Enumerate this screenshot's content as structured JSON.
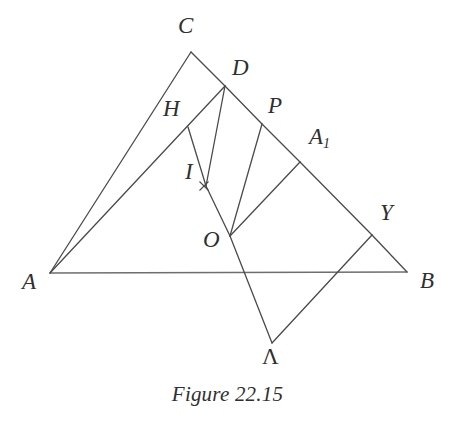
{
  "figure": {
    "caption": "Figure 22.15",
    "stroke_color": "#4a4a4a",
    "baseline_color": "#6e6e6e",
    "background_color": "#ffffff",
    "stroke_width": 1.3
  },
  "points": {
    "A": {
      "label": "A",
      "x": 50,
      "y": 273,
      "label_x": 22,
      "label_y": 270
    },
    "B": {
      "label": "B",
      "x": 407,
      "y": 272,
      "label_x": 420,
      "label_y": 269
    },
    "C": {
      "label": "C",
      "x": 191,
      "y": 52,
      "label_x": 178,
      "label_y": 14
    },
    "D": {
      "label": "D",
      "x": 225,
      "y": 86,
      "label_x": 232,
      "label_y": 56
    },
    "H": {
      "label": "H",
      "x": 188,
      "y": 127,
      "label_x": 163,
      "label_y": 97
    },
    "P": {
      "label": "P",
      "x": 262,
      "y": 124,
      "label_x": 268,
      "label_y": 94
    },
    "A1": {
      "label": "A",
      "sub": "1",
      "x": 300,
      "y": 162,
      "label_x": 309,
      "label_y": 125
    },
    "I": {
      "label": "I",
      "x": 204,
      "y": 185,
      "label_x": 185,
      "label_y": 160
    },
    "O": {
      "label": "O",
      "x": 230,
      "y": 236,
      "label_x": 203,
      "label_y": 228
    },
    "Y": {
      "label": "Y",
      "x": 372,
      "y": 235,
      "label_x": 380,
      "label_y": 201
    },
    "Lambda": {
      "label": "Λ",
      "x": 272,
      "y": 343,
      "label_x": 262,
      "label_y": 345
    },
    "Q": {
      "label": "",
      "x": 206,
      "y": 186
    }
  },
  "segments": [
    {
      "name": "base-AB",
      "from": "A",
      "to": "B",
      "role": "baseline"
    },
    {
      "name": "side-AC",
      "from": "A",
      "to": "C",
      "role": "outline"
    },
    {
      "name": "side-CD",
      "from": "C",
      "to": "D",
      "role": "outline"
    },
    {
      "name": "side-DP",
      "from": "D",
      "to": "P",
      "role": "outline"
    },
    {
      "name": "side-PA1",
      "from": "P",
      "to": "A1",
      "role": "outline"
    },
    {
      "name": "side-A1Y",
      "from": "A1",
      "to": "Y",
      "role": "outline"
    },
    {
      "name": "side-YB",
      "from": "Y",
      "to": "B",
      "role": "outline"
    },
    {
      "name": "cevian-A-to-D",
      "from": "A",
      "to": "D",
      "role": "cevian"
    },
    {
      "name": "segment-H-to-Q",
      "from": "H",
      "to": "Q",
      "role": "construction"
    },
    {
      "name": "segment-D-to-Q",
      "from": "D",
      "to": "Q",
      "role": "construction"
    },
    {
      "name": "segment-Q-to-O",
      "from": "Q",
      "to": "O",
      "role": "construction"
    },
    {
      "name": "segment-P-to-O",
      "from": "P",
      "to": "O",
      "role": "construction"
    },
    {
      "name": "segment-A1-to-O",
      "from": "A1",
      "to": "O",
      "role": "construction"
    },
    {
      "name": "segment-O-lambda",
      "from": "O",
      "to": "Lambda",
      "role": "construction"
    },
    {
      "name": "segment-lambda-Y",
      "from": "Lambda",
      "to": "Y",
      "role": "construction"
    }
  ],
  "markers": [
    {
      "name": "intersection-cross-I",
      "x": 204,
      "y": 186,
      "size": 4.5
    }
  ]
}
